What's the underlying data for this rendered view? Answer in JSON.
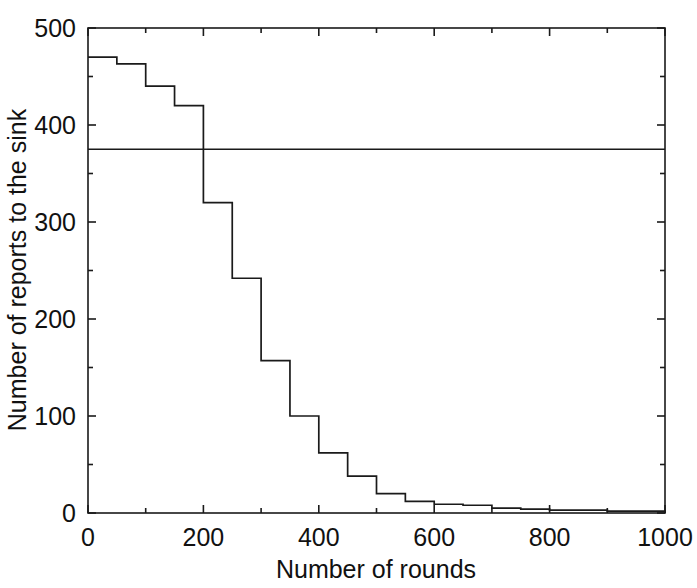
{
  "chart_data": {
    "type": "line",
    "subtype": "step-survival-curve",
    "title": "",
    "xlabel": "Number of rounds",
    "ylabel": "Number of reports to the sink",
    "xlim": [
      0,
      1000
    ],
    "ylim": [
      0,
      500
    ],
    "grid": false,
    "legend": null,
    "xticks": [
      0,
      200,
      400,
      600,
      800,
      1000
    ],
    "xtick_labels": [
      "0",
      "200",
      "400",
      "600",
      "800",
      "1000"
    ],
    "xticks_minor": [
      100,
      300,
      500,
      700,
      900
    ],
    "yticks": [
      0,
      100,
      200,
      300,
      400,
      500
    ],
    "ytick_labels": [
      "0",
      "100",
      "200",
      "300",
      "400",
      "500"
    ],
    "yticks_minor": [
      50,
      150,
      250,
      350,
      450
    ],
    "series": [
      {
        "name": "reports-to-sink-step",
        "style": "step-post",
        "color": "#1a1a1a",
        "x": [
          0,
          50,
          100,
          150,
          200,
          250,
          300,
          350,
          400,
          450,
          500,
          550,
          600,
          650,
          700,
          750,
          800,
          850,
          900,
          950,
          1000
        ],
        "values": [
          470,
          463,
          440,
          420,
          320,
          242,
          157,
          100,
          62,
          38,
          20,
          12,
          9,
          8,
          5,
          4,
          3,
          3,
          2,
          2,
          0
        ]
      },
      {
        "name": "horizontal-reference-line",
        "style": "horizontal-line",
        "color": "#1a1a1a",
        "y": 375
      }
    ]
  },
  "axes": {
    "x_axis_label": "Number of rounds",
    "y_axis_label": "Number of reports to the sink"
  }
}
